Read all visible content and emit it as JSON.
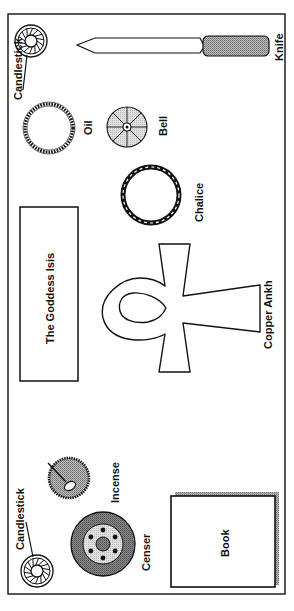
{
  "diagram": {
    "type": "altar-layout",
    "colors": {
      "line": "#111111",
      "shade_dark": "#7a7a7a",
      "shade_mid": "#a8a8a8",
      "shade_light": "#d6d6d6",
      "background": "#ffffff"
    },
    "items": {
      "candlestick_top": {
        "label": "Candlestick",
        "icon": "candlestick-icon"
      },
      "knife": {
        "label": "Knife",
        "icon": "knife-icon"
      },
      "oil": {
        "label": "Oil",
        "icon": "oil-icon"
      },
      "bell": {
        "label": "Bell",
        "icon": "bell-icon"
      },
      "chalice": {
        "label": "Chalice",
        "icon": "chalice-icon"
      },
      "goddess": {
        "label": "The Goddess Isis",
        "icon": "goddess-panel"
      },
      "ankh": {
        "label": "Copper Ankh",
        "icon": "ankh-icon"
      },
      "incense": {
        "label": "Incense",
        "icon": "incense-icon"
      },
      "censer": {
        "label": "Censer",
        "icon": "censer-icon"
      },
      "candlestick_bottom": {
        "label": "Candlestick",
        "icon": "candlestick-icon"
      },
      "book": {
        "label": "Book",
        "icon": "book-icon"
      }
    }
  }
}
